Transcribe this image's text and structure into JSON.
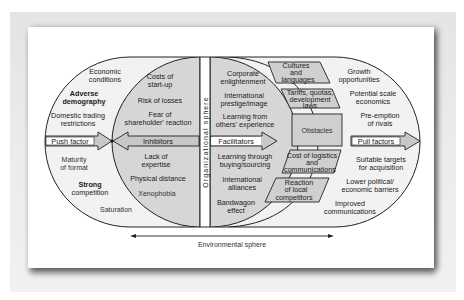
{
  "diagram": {
    "push_side": {
      "items": [
        "Economic",
        "conditions",
        "Adverse",
        "demography",
        "Domestic trading",
        "restrictions",
        "Maturity",
        "of format",
        "Strong",
        "competition",
        "Saturation"
      ],
      "arrow_label": "Push factor"
    },
    "inhibitors": {
      "items": [
        "Costs of",
        "start-up",
        "Risk of losses",
        "Fear of",
        "shareholder' reaction",
        "Lack of",
        "expertise",
        "Physical distance",
        "Xenophobia"
      ],
      "arrow_label": "Inhibitors"
    },
    "organizational_sphere_label": "Organizational sphere",
    "facilitators": {
      "items": [
        "Corporate",
        "enlightenment",
        "International",
        "prestige/image",
        "Learning from",
        "others' experience",
        "Learning through",
        "buying/sourcing",
        "International",
        "alliances",
        "Bandwagon",
        "effect"
      ],
      "arrow_label": "Facilitators"
    },
    "obstacles": {
      "items": [
        "Cultures",
        "and",
        "languages",
        "Tariffs, quotas,",
        "development",
        "laws",
        "Cost of logistics",
        "and",
        "communications",
        "Reaction",
        "of local",
        "competitors"
      ],
      "center_label": "Obstacles"
    },
    "pull_side": {
      "items": [
        "Growth",
        "opportunities",
        "Potential scale",
        "economics",
        "Pre-emption",
        "of rivals",
        "Suitable targets",
        "for acquisition",
        "Lower political/",
        "economic barriers",
        "Improved",
        "communications"
      ],
      "arrow_label": "Pull factors"
    },
    "environmental_sphere_label": "Environmental sphere"
  },
  "colors": {
    "outer_fill": "#f2f2f2",
    "inner_fill": "#d6d6d6",
    "box_fill": "#cfcfcf",
    "arrow_fill": "#c8c8c8",
    "stroke": "#222222"
  }
}
